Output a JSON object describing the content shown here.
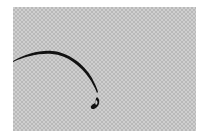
{
  "image": {
    "description": "Curved brush stroke on transparent (checkerboard) background",
    "background": "transparency-checkerboard",
    "stroke_color": "#111111",
    "checker_light": "#cfcfcf",
    "checker_dark": "#b9b9b9"
  }
}
